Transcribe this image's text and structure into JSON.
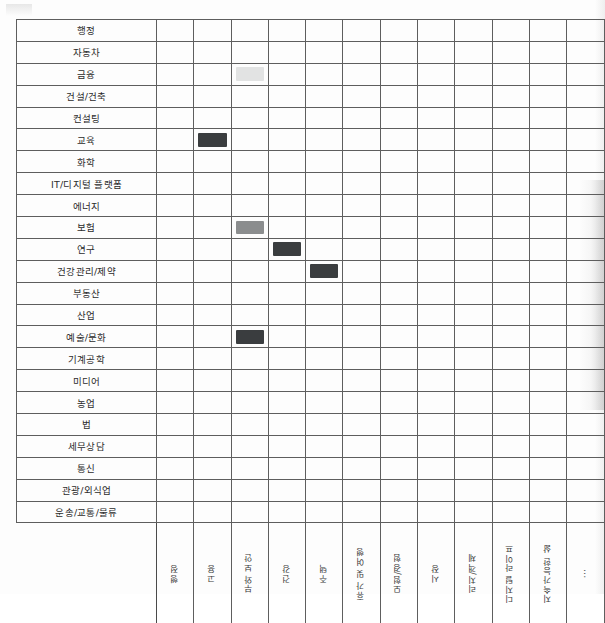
{
  "document": {
    "type": "printed-matrix-table",
    "title_visible": false
  },
  "matrix": {
    "row_label_header": "",
    "rows": [
      {
        "label": "행정"
      },
      {
        "label": "자동차"
      },
      {
        "label": "금융"
      },
      {
        "label": "건설/건축"
      },
      {
        "label": "컨설팅"
      },
      {
        "label": "교육"
      },
      {
        "label": "화학"
      },
      {
        "label": "IT/디지털 플랫폼"
      },
      {
        "label": "에너지"
      },
      {
        "label": "보험"
      },
      {
        "label": "연구"
      },
      {
        "label": "건강관리/제약"
      },
      {
        "label": "부동산"
      },
      {
        "label": "산업"
      },
      {
        "label": "예술/문화"
      },
      {
        "label": "기계공학"
      },
      {
        "label": "미디어"
      },
      {
        "label": "농업"
      },
      {
        "label": "법"
      },
      {
        "label": "세무상담"
      },
      {
        "label": "통신"
      },
      {
        "label": "관광/외식업"
      },
      {
        "label": "운송/교통/물류"
      }
    ],
    "columns": [
      {
        "label": "행정"
      },
      {
        "label": "고용"
      },
      {
        "label": "부와 보안"
      },
      {
        "label": "건강"
      },
      {
        "label": "주택"
      },
      {
        "label": "휴가 및 여행"
      },
      {
        "label": "모험/경험"
      },
      {
        "label": "시장"
      },
      {
        "label": "리치/객체"
      },
      {
        "label": "디지털 라이프"
      },
      {
        "label": "지속가능한 삶"
      },
      {
        "label": "⋯"
      }
    ],
    "fills": {
      "dark": "#3a3d3f",
      "medium": "#8b8d8e",
      "light": "#e2e3e3"
    },
    "marked_cells": [
      {
        "row": 2,
        "row_label": "금융",
        "col": 2,
        "col_label": "부와 보안",
        "shade": "light"
      },
      {
        "row": 5,
        "row_label": "교육",
        "col": 1,
        "col_label": "고용",
        "shade": "dark"
      },
      {
        "row": 9,
        "row_label": "보험",
        "col": 2,
        "col_label": "부와 보안",
        "shade": "medium"
      },
      {
        "row": 10,
        "row_label": "연구",
        "col": 3,
        "col_label": "건강",
        "shade": "dark"
      },
      {
        "row": 11,
        "row_label": "건강관리/제약",
        "col": 4,
        "col_label": "주택",
        "shade": "dark"
      },
      {
        "row": 14,
        "row_label": "예술/문화",
        "col": 2,
        "col_label": "부와 보안",
        "shade": "dark"
      }
    ]
  }
}
